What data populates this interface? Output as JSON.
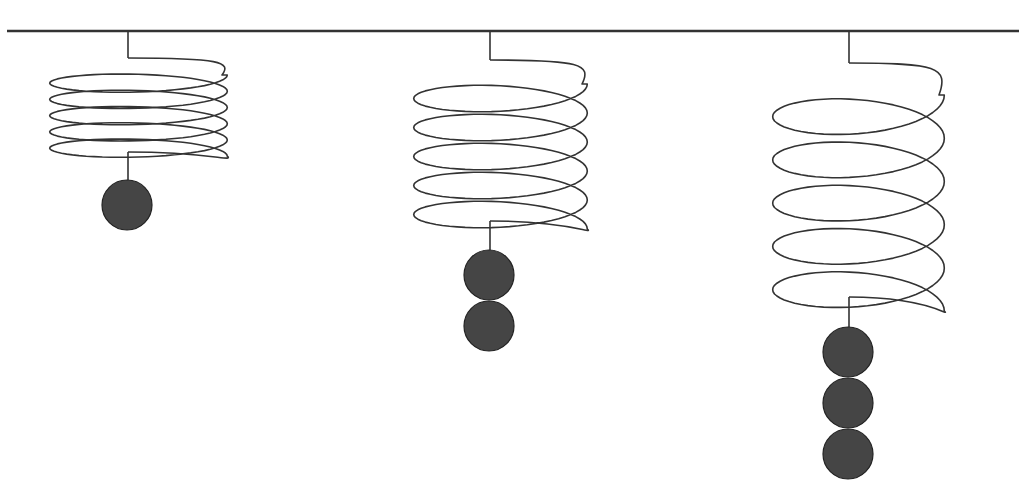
{
  "title": {
    "text": "",
    "note": "header text clipped at top edge; only bottom strokes visible"
  },
  "colors": {
    "line": "#333333",
    "ball_fill": "#454545",
    "ball_stroke": "#222222",
    "background": "#ffffff"
  },
  "diagram": {
    "support_bar": {
      "x1": 7,
      "x2": 1019,
      "y": 31
    },
    "springs": [
      {
        "id": "spring-1",
        "stem_x": 128,
        "top_stem_end_y": 58,
        "coil_left": 47,
        "coil_right": 230,
        "coil_top": 75,
        "coil_bottom": 140,
        "turns": 5,
        "bottom_stem_start_y": 152,
        "bottom_stem_end_y": 180,
        "weights": 1,
        "ball_radius": 25,
        "first_ball_cy": 205
      },
      {
        "id": "spring-2",
        "stem_x": 490,
        "top_stem_end_y": 60,
        "coil_left": 411,
        "coil_right": 590,
        "coil_top": 84,
        "coil_bottom": 200,
        "turns": 5,
        "bottom_stem_start_y": 221,
        "bottom_stem_end_y": 250,
        "weights": 2,
        "ball_radius": 25,
        "first_ball_cy": 275
      },
      {
        "id": "spring-3",
        "stem_x": 849,
        "top_stem_end_y": 63,
        "coil_left": 770,
        "coil_right": 947,
        "coil_top": 95,
        "coil_bottom": 268,
        "turns": 5,
        "bottom_stem_start_y": 297,
        "bottom_stem_end_y": 327,
        "weights": 3,
        "ball_radius": 25,
        "first_ball_cy": 352
      }
    ]
  }
}
